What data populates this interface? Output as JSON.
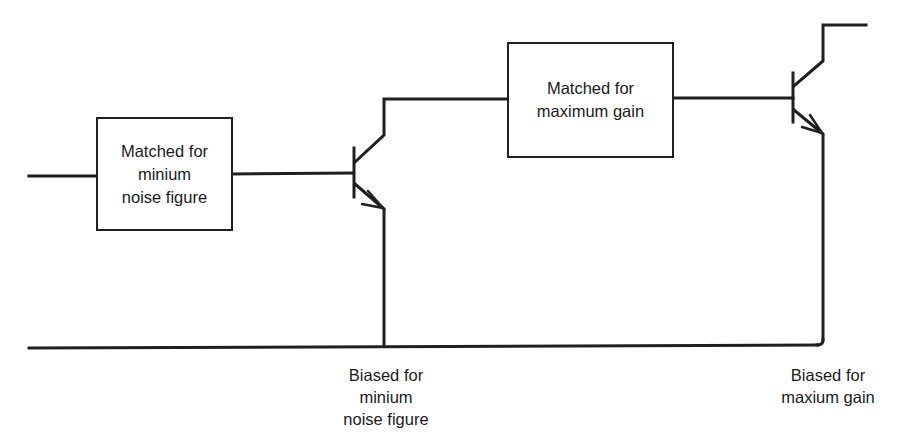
{
  "diagram": {
    "type": "two-stage transistor amplifier block diagram",
    "stroke_color": "#1f1f1f",
    "blocks": [
      {
        "id": "input-match",
        "lines": [
          "Matched for",
          "minium",
          "noise figure"
        ]
      },
      {
        "id": "interstage-match",
        "lines": [
          "Matched for",
          "maximum gain"
        ]
      }
    ],
    "transistors": [
      {
        "id": "q1",
        "type": "npn"
      },
      {
        "id": "q2",
        "type": "npn"
      }
    ],
    "labels": [
      {
        "id": "bias1",
        "lines": [
          "Biased for",
          "minium",
          "noise figure"
        ]
      },
      {
        "id": "bias2",
        "lines": [
          "Biased for",
          "maxium gain"
        ]
      }
    ]
  }
}
